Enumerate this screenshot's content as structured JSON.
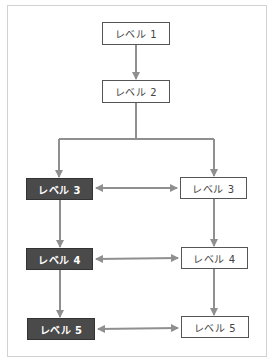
{
  "diagram": {
    "type": "flowchart",
    "colors": {
      "dark_fill": "#4a4a4a",
      "light_fill": "#ffffff",
      "arrow": "#8f8f8f",
      "frame": "#d2d2d2"
    },
    "nodes": {
      "level1": {
        "label": "レベル 1",
        "style": "light"
      },
      "level2": {
        "label": "レベル 2",
        "style": "light"
      },
      "left3": {
        "label": "レベル 3",
        "style": "dark"
      },
      "left4": {
        "label": "レベル 4",
        "style": "dark"
      },
      "left5": {
        "label": "レベル 5",
        "style": "dark"
      },
      "right3": {
        "label": "レベル 3",
        "style": "light"
      },
      "right4": {
        "label": "レベル 4",
        "style": "light"
      },
      "right5": {
        "label": "レベル 5",
        "style": "light"
      }
    },
    "edges": [
      {
        "from": "level1",
        "to": "level2",
        "type": "arrow"
      },
      {
        "from": "level2",
        "to": "left3",
        "type": "arrow"
      },
      {
        "from": "level2",
        "to": "right3",
        "type": "arrow"
      },
      {
        "from": "left3",
        "to": "left4",
        "type": "arrow"
      },
      {
        "from": "left4",
        "to": "left5",
        "type": "arrow"
      },
      {
        "from": "right3",
        "to": "right4",
        "type": "arrow"
      },
      {
        "from": "right4",
        "to": "right5",
        "type": "arrow"
      },
      {
        "from": "left3",
        "to": "right3",
        "type": "bidirectional"
      },
      {
        "from": "left4",
        "to": "right4",
        "type": "bidirectional"
      },
      {
        "from": "left5",
        "to": "right5",
        "type": "bidirectional"
      }
    ]
  }
}
